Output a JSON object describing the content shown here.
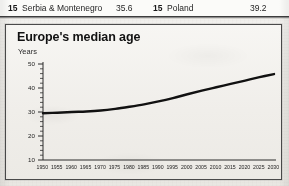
{
  "table_row": {
    "left": {
      "rank": "15",
      "country": "Serbia & Montenegro",
      "value": "35.6"
    },
    "right": {
      "rank": "15",
      "country": "Poland",
      "value": "39.2"
    }
  },
  "chart_data": {
    "type": "line",
    "title": "Europe's median age",
    "subtitle": "Years",
    "xlabel": "",
    "ylabel": "Years",
    "ylim": [
      10,
      50
    ],
    "y_ticks": [
      10,
      20,
      30,
      40,
      50
    ],
    "y_minor_step": 2,
    "grid": false,
    "legend": "none",
    "line_color": "#111111",
    "categories": [
      "1950",
      "1955",
      "1960",
      "1965",
      "1970",
      "1975",
      "1980",
      "1985",
      "1990",
      "1995",
      "2000",
      "2005",
      "2010",
      "2015",
      "2020",
      "2025",
      "2030"
    ],
    "values": [
      29.5,
      29.7,
      30.0,
      30.2,
      30.6,
      31.3,
      32.2,
      33.2,
      34.4,
      35.8,
      37.4,
      38.9,
      40.3,
      41.7,
      43.1,
      44.5,
      45.8
    ]
  }
}
